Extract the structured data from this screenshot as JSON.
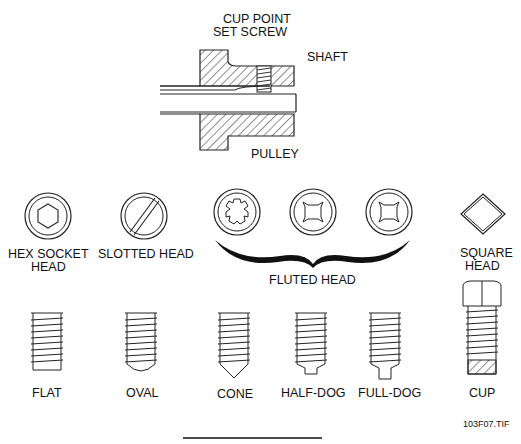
{
  "top_figure": {
    "title_line1": "CUP POINT",
    "title_line2": "SET SCREW",
    "shaft_label": "SHAFT",
    "pulley_label": "PULLEY"
  },
  "heads": [
    {
      "label": "HEX SOCKET",
      "label2": "HEAD"
    },
    {
      "label": "SLOTTED HEAD"
    },
    {
      "label": "FLUTED HEAD"
    },
    {
      "label": "SQUARE",
      "label2": "HEAD"
    }
  ],
  "points": [
    {
      "label": "FLAT"
    },
    {
      "label": "OVAL"
    },
    {
      "label": "CONE"
    },
    {
      "label": "HALF-DOG"
    },
    {
      "label": "FULL-DOG"
    },
    {
      "label": "CUP"
    }
  ],
  "figure_id": "103F07.TIF"
}
